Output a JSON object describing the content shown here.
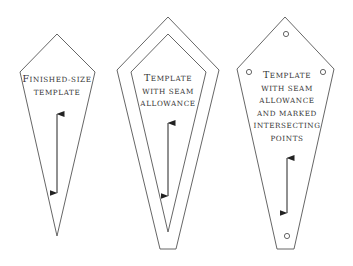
{
  "colors": {
    "background": "#ffffff",
    "outline": "#555555",
    "arrow": "#222222",
    "text": "#333333"
  },
  "templates": [
    {
      "id": "finished-size",
      "label_lines": [
        "Finished-size",
        "template"
      ],
      "label_first_letter_large": true,
      "has_seam_allowance": false,
      "has_marked_points": false,
      "grainline_arrow": "double-headed vertical"
    },
    {
      "id": "seam-allowance",
      "label_lines": [
        "Template",
        "with seam",
        "allowance"
      ],
      "label_first_letter_large": true,
      "has_seam_allowance": true,
      "has_marked_points": false,
      "grainline_arrow": "double-headed vertical"
    },
    {
      "id": "seam-allowance-marked",
      "label_lines": [
        "Template",
        "with seam",
        "allowance",
        "and marked",
        "intersecting",
        "points"
      ],
      "label_first_letter_large": true,
      "has_seam_allowance": true,
      "has_marked_points": true,
      "marked_points_count": 4,
      "grainline_arrow": "double-headed vertical"
    }
  ]
}
